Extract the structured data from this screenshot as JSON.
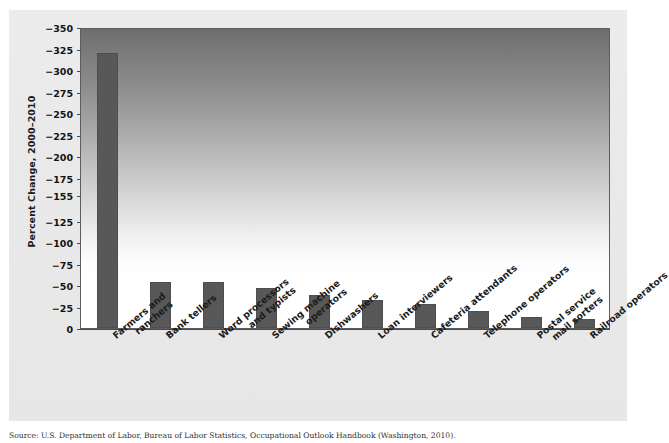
{
  "figure": {
    "background_color": "#e9e9ea",
    "plot_border_color": "#5d5d5d",
    "bar_color": "#585858",
    "plot_gradient_top": "#6e6e6e",
    "plot_gradient_bottom": "#ffffff"
  },
  "axis": {
    "ylabel": "Percent Change, 2000–2010",
    "ticklabels": [
      "−350",
      "−325",
      "−300",
      "−275",
      "−250",
      "−225",
      "−200",
      "−175",
      "−155",
      "−125",
      "−100",
      "−75",
      "−50",
      "−25",
      "0"
    ]
  },
  "caption": {
    "text": "Source: U.S. Department of Labor, Bureau of Labor Statistics, Occupational Outlook Handbook (Washington, 2010)."
  },
  "chart_data": {
    "type": "bar",
    "title": "",
    "xlabel": "",
    "ylabel": "Percent Change, 2000–2010",
    "grid": false,
    "legend": "none",
    "y_axis_inverted": true,
    "ylim": [
      0,
      -350
    ],
    "ytick_values": [
      -350,
      -325,
      -300,
      -275,
      -250,
      -225,
      -200,
      -175,
      -155,
      -125,
      -100,
      -75,
      -50,
      -25,
      0
    ],
    "ytick_labels": [
      "−350",
      "−325",
      "−300",
      "−275",
      "−250",
      "−225",
      "−200",
      "−175",
      "−155",
      "−125",
      "−100",
      "−75",
      "−50",
      "−25",
      "0"
    ],
    "categories": [
      "Farmers and ranchers",
      "Bank tellers",
      "Word processors and typists",
      "Sewing machine operators",
      "Dishwashers",
      "Loan interviewers",
      "Cafeteria attendants",
      "Telephone operators",
      "Postal service mail sorters",
      "Railroad operators"
    ],
    "category_lines": [
      [
        "Farmers and",
        "ranchers"
      ],
      [
        "Bank tellers"
      ],
      [
        "Word processors",
        "and typists"
      ],
      [
        "Sewing machine",
        "operators"
      ],
      [
        "Dishwashers"
      ],
      [
        "Loan interviewers"
      ],
      [
        "Cafeteria attendants"
      ],
      [
        "Telephone operators"
      ],
      [
        "Postal service",
        "mail sorters"
      ],
      [
        "Railroad operators"
      ]
    ],
    "values": [
      -320,
      -53,
      -53,
      -46,
      -38,
      -32,
      -28,
      -20,
      -13,
      -11
    ]
  }
}
